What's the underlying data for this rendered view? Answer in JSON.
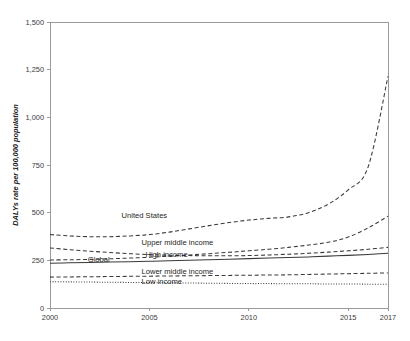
{
  "chart_data": {
    "type": "line",
    "title": "",
    "xlabel": "",
    "ylabel": "DALYs rate per 100,000 population",
    "xlim": [
      2000,
      2017
    ],
    "ylim": [
      0,
      1500
    ],
    "xticks": [
      "2000",
      "2005",
      "2010",
      "2015",
      "2017"
    ],
    "xtick_values": [
      2000,
      2005,
      2010,
      2015,
      2017
    ],
    "yticks": [
      "0",
      "250",
      "500",
      "750",
      "1,000",
      "1,250",
      "1,500"
    ],
    "ytick_values": [
      0,
      250,
      500,
      750,
      1000,
      1250,
      1500
    ],
    "grid": false,
    "legend": "inline-labels",
    "x": [
      2000,
      2001,
      2002,
      2003,
      2004,
      2005,
      2006,
      2007,
      2008,
      2009,
      2010,
      2011,
      2012,
      2013,
      2014,
      2015,
      2016,
      2017
    ],
    "series": [
      {
        "name": "United States",
        "style": "dashed",
        "label_x": 2003.6,
        "label_y": 470,
        "values": [
          385,
          378,
          374,
          374,
          378,
          385,
          398,
          415,
          432,
          448,
          461,
          470,
          478,
          500,
          545,
          620,
          740,
          1215
        ]
      },
      {
        "name": "Upper middle income",
        "style": "dashed",
        "label_x": 2004.6,
        "label_y": 330,
        "values": [
          252,
          253,
          255,
          258,
          262,
          266,
          272,
          278,
          285,
          292,
          300,
          308,
          318,
          330,
          345,
          372,
          420,
          482
        ]
      },
      {
        "name": "High income",
        "style": "dashed",
        "label_x": 2004.8,
        "label_y": 268,
        "values": [
          315,
          306,
          298,
          291,
          285,
          280,
          277,
          275,
          274,
          274,
          275,
          278,
          282,
          287,
          293,
          300,
          308,
          318
        ]
      },
      {
        "name": "Global",
        "style": "solid",
        "label_x": 2001.9,
        "label_y": 243,
        "values": [
          235,
          237,
          239,
          241,
          243,
          245,
          248,
          250,
          253,
          256,
          259,
          262,
          265,
          268,
          272,
          276,
          281,
          287
        ]
      },
      {
        "name": "Lower middle income",
        "style": "dashed",
        "label_x": 2004.6,
        "label_y": 178,
        "values": [
          162,
          163,
          164,
          165,
          166,
          167,
          168,
          169,
          170,
          171,
          172,
          173,
          174,
          176,
          178,
          180,
          182,
          184
        ]
      },
      {
        "name": "Low income",
        "style": "dotted",
        "label_x": 2004.6,
        "label_y": 128,
        "values": [
          138,
          137,
          136,
          135,
          134,
          133,
          132,
          131,
          130,
          129,
          128,
          128,
          127,
          127,
          126,
          126,
          125,
          125
        ]
      }
    ]
  }
}
